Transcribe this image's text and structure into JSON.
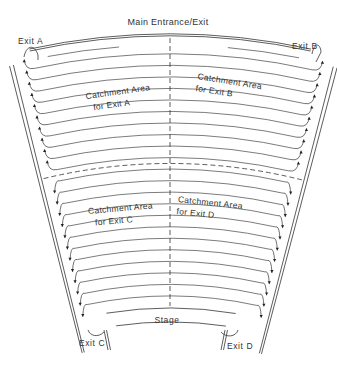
{
  "diagram": {
    "title": "Main Entrance/Exit",
    "stage_label": "Stage",
    "exits": [
      {
        "id": "A",
        "label": "Exit A"
      },
      {
        "id": "B",
        "label": "Exit B"
      },
      {
        "id": "C",
        "label": "Exit C"
      },
      {
        "id": "D",
        "label": "Exit D"
      }
    ],
    "catchment_areas": [
      {
        "id": "A",
        "line1": "Catchment Area",
        "line2": "for Exit A"
      },
      {
        "id": "B",
        "line1": "Catchment Area",
        "line2": "for Exit B"
      },
      {
        "id": "C",
        "line1": "Catchment Area",
        "line2": "for Exit C"
      },
      {
        "id": "D",
        "line1": "Catchment Area",
        "line2": "for Exit D"
      }
    ],
    "rows": {
      "upper_section_rows": 10,
      "lower_section_rows": 12
    },
    "colors": {
      "line": "#333333",
      "background": "#ffffff"
    }
  }
}
